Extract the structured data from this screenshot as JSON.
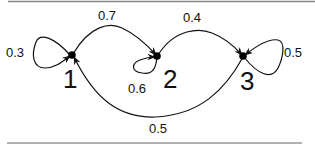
{
  "diagram": {
    "type": "markov-chain",
    "nodes": [
      {
        "id": "1",
        "label": "1",
        "x": 72,
        "y": 55
      },
      {
        "id": "2",
        "label": "2",
        "x": 157,
        "y": 56
      },
      {
        "id": "3",
        "label": "3",
        "x": 243,
        "y": 56
      }
    ],
    "edges": [
      {
        "from": "1",
        "to": "1",
        "label": "0.3"
      },
      {
        "from": "1",
        "to": "2",
        "label": "0.7"
      },
      {
        "from": "2",
        "to": "2",
        "label": "0.6"
      },
      {
        "from": "2",
        "to": "3",
        "label": "0.4"
      },
      {
        "from": "3",
        "to": "3",
        "label": "0.5"
      },
      {
        "from": "3",
        "to": "1",
        "label": "0.5"
      }
    ]
  }
}
